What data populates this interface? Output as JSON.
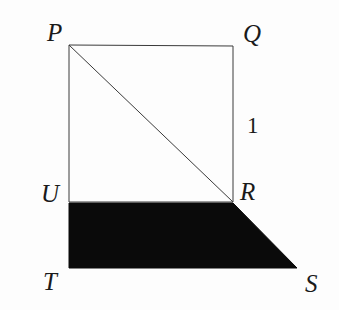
{
  "figure": {
    "background_color": "#fdfdfd",
    "stroke_color": "#3a3a3a",
    "fill_color": "#0a0a0a",
    "labels": {
      "P": "P",
      "Q": "Q",
      "R": "R",
      "S": "S",
      "T": "T",
      "U": "U",
      "side_length": "1"
    }
  },
  "chart_data": {
    "type": "diagram",
    "xlabel": "",
    "ylabel": "",
    "points": [
      {
        "name": "P",
        "label": "P",
        "x": 69,
        "y": 45,
        "label_x": 47,
        "label_y": 20
      },
      {
        "name": "Q",
        "label": "Q",
        "x": 233,
        "y": 46,
        "label_x": 243,
        "label_y": 21
      },
      {
        "name": "R",
        "label": "R",
        "x": 233,
        "y": 202,
        "label_x": 240,
        "label_y": 179
      },
      {
        "name": "U",
        "label": "U",
        "x": 69,
        "y": 202,
        "label_x": 41,
        "label_y": 181
      },
      {
        "name": "T",
        "label": "T",
        "x": 69,
        "y": 268,
        "label_x": 43,
        "label_y": 269
      },
      {
        "name": "S",
        "label": "S",
        "x": 297,
        "y": 268,
        "label_x": 305,
        "label_y": 271
      }
    ],
    "shapes": [
      {
        "name": "square-PQRU",
        "kind": "polygon",
        "vertices": "P,Q,R,U",
        "points": "69,45 233,46 233,202 69,202",
        "fill": "none",
        "stroke": "#3a3a3a",
        "stroke_width": 1
      },
      {
        "name": "diagonal-PR",
        "kind": "line",
        "from": "P",
        "to": "R",
        "x1": 69,
        "y1": 45,
        "x2": 233,
        "y2": 202,
        "stroke": "#3a3a3a",
        "stroke_width": 1
      },
      {
        "name": "shaded-trapezoid-URST",
        "kind": "polygon",
        "vertices": "U,R,S,T",
        "points": "69,203 233,203 297,268 69,268",
        "fill": "#0a0a0a",
        "stroke": "#0a0a0a",
        "stroke_width": 1
      }
    ],
    "annotations": [
      {
        "name": "side-length-QR",
        "text": "1",
        "attached_to": "segment QR",
        "x": 247,
        "y": 114
      }
    ],
    "legend": [],
    "grid": false
  }
}
